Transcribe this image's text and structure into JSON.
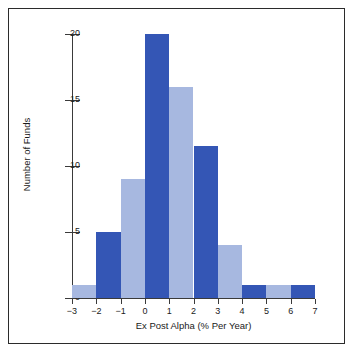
{
  "chart_data": {
    "type": "bar",
    "title": "",
    "subtitle": "",
    "xlabel": "Ex Post Alpha (% Per Year)",
    "ylabel": "Number of Funds",
    "xlim": [
      -3,
      7
    ],
    "ylim": [
      0,
      20
    ],
    "x_ticks": [
      -3,
      -2,
      -1,
      0,
      1,
      2,
      3,
      4,
      5,
      6,
      7
    ],
    "x_tick_labels": [
      "−3",
      "−2",
      "−1",
      "0",
      "1",
      "2",
      "3",
      "4",
      "5",
      "6",
      "7"
    ],
    "y_ticks": [
      0,
      5,
      10,
      15,
      20
    ],
    "y_tick_labels": [
      "0",
      "5",
      "10",
      "15",
      "20"
    ],
    "grid": false,
    "legend": null,
    "bin_width": 1,
    "bins": [
      {
        "label": "−3 to −2",
        "x0": -3,
        "x1": -2,
        "value": 1,
        "color": "#a7b8e0"
      },
      {
        "label": "−2 to −1",
        "x0": -2,
        "x1": -1,
        "value": 5,
        "color": "#3456b5"
      },
      {
        "label": "−1 to 0",
        "x0": -1,
        "x1": 0,
        "value": 9,
        "color": "#a7b8e0"
      },
      {
        "label": "0 to 1",
        "x0": 0,
        "x1": 1,
        "value": 20,
        "color": "#3456b5"
      },
      {
        "label": "1 to 2",
        "x0": 1,
        "x1": 2,
        "value": 16,
        "color": "#a7b8e0"
      },
      {
        "label": "2 to 3",
        "x0": 2,
        "x1": 3,
        "value": 11.5,
        "color": "#3456b5"
      },
      {
        "label": "3 to 4",
        "x0": 3,
        "x1": 4,
        "value": 4,
        "color": "#a7b8e0"
      },
      {
        "label": "4 to 5",
        "x0": 4,
        "x1": 5,
        "value": 1,
        "color": "#3456b5"
      },
      {
        "label": "5 to 6",
        "x0": 5,
        "x1": 6,
        "value": 1,
        "color": "#a7b8e0"
      },
      {
        "label": "6 to 7",
        "x0": 6,
        "x1": 7,
        "value": 1,
        "color": "#3456b5"
      }
    ],
    "categories": [
      "−3 to −2",
      "−2 to −1",
      "−1 to 0",
      "0 to 1",
      "1 to 2",
      "2 to 3",
      "3 to 4",
      "4 to 5",
      "5 to 6",
      "6 to 7"
    ],
    "values": [
      1,
      5,
      9,
      20,
      16,
      11.5,
      4,
      1,
      1,
      1
    ],
    "colors": {
      "bar_light": "#a7b8e0",
      "bar_dark": "#3456b5",
      "axis": "#3a3a3a",
      "frame": "#2b2b2b",
      "background": "#ffffff",
      "text": "#1a1a1a"
    }
  }
}
